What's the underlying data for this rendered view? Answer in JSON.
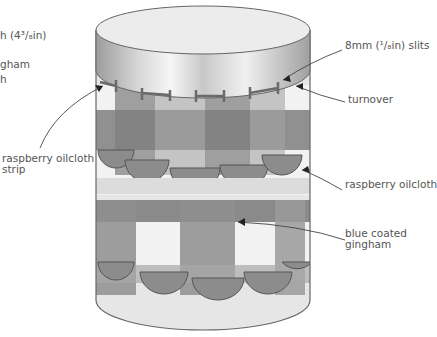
{
  "diagram": {
    "labels": {
      "top_left_1": "h (4³/₈in)",
      "top_left_2": "gham",
      "top_left_3": "h",
      "strip_1": "raspberry oilcloth",
      "strip_2": "strip",
      "slits": "8mm (¹/₈in) slits",
      "turnover": "turnover",
      "raspberry": "raspberry oilcloth",
      "blue_1": "blue coated",
      "blue_2": "gingham"
    },
    "colors": {
      "lid_light": "#e8e8e8",
      "lid_mid": "#bdbdbd",
      "gingham_dark": "#7a7a7a",
      "gingham_mid": "#a6a6a6",
      "gingham_light": "#f4f4f4",
      "scallop": "#8c8c8c",
      "outline": "#555555"
    }
  }
}
